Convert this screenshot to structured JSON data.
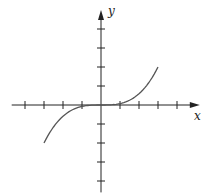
{
  "chart_data": {
    "type": "line",
    "title": "",
    "xlabel": "x",
    "ylabel": "y",
    "xlim": [
      -4.7,
      5.2
    ],
    "ylim": [
      -4.6,
      5.0
    ],
    "x_ticks": [
      -4,
      -3,
      -2,
      -1,
      1,
      2,
      3,
      4
    ],
    "y_ticks": [
      -4,
      -3,
      -2,
      -1,
      1,
      2,
      3,
      4
    ],
    "tick_labels_shown": false,
    "grid": false,
    "legend": null,
    "series": [
      {
        "name": "curve",
        "description": "cubic-like curve, flat near origin, y ≈ (2/27)·x³",
        "x": [
          -3,
          -2.5,
          -2,
          -1.5,
          -1,
          -0.5,
          0,
          0.5,
          1,
          1.5,
          2,
          2.5,
          3
        ],
        "y": [
          -2,
          -1.16,
          -0.59,
          -0.25,
          -0.07,
          -0.01,
          0,
          0.01,
          0.07,
          0.25,
          0.59,
          1.16,
          2
        ]
      }
    ]
  },
  "colors": {
    "axis": "#222222",
    "curve": "#555555"
  }
}
